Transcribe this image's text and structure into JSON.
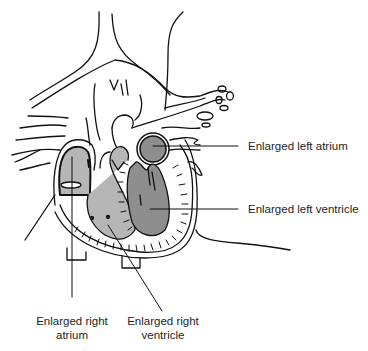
{
  "figure": {
    "colors": {
      "outline": "#111111",
      "left_chamber_fill": "#8e8e8e",
      "right_chamber_fill": "#b6b6b6",
      "background": "#ffffff",
      "label_text": "#1e1e1e"
    },
    "labels": {
      "left_atrium": "Enlarged left atrium",
      "left_ventricle": "Enlarged left ventricle",
      "right_atrium_line1": "Enlarged right",
      "right_atrium_line2": "atrium",
      "right_ventricle_line1": "Enlarged right",
      "right_ventricle_line2": "ventricle"
    }
  }
}
